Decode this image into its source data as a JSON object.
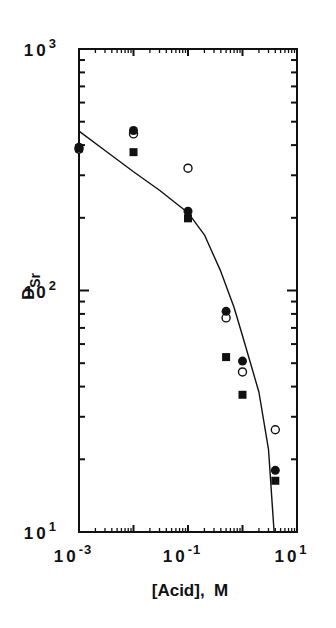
{
  "chart_data": {
    "type": "scatter",
    "title": "",
    "xlabel": "[Acid],  M",
    "ylabel": "D",
    "ylabel_subscript": "Sr",
    "xscale": "log",
    "yscale": "log",
    "xlim": [
      0.001,
      10
    ],
    "ylim": [
      10,
      1000
    ],
    "x_tick_labels": [
      {
        "base": "10",
        "exp": "-3",
        "value": 0.001
      },
      {
        "base": "10",
        "exp": "-1",
        "value": 0.1
      },
      {
        "base": "10",
        "exp": "1",
        "value": 10
      }
    ],
    "y_tick_labels": [
      {
        "base": "10",
        "exp": "3",
        "value": 1000
      },
      {
        "base": "10",
        "exp": "2",
        "value": 100
      },
      {
        "base": "10",
        "exp": "1",
        "value": 10
      }
    ],
    "grid": false,
    "legend": null,
    "series": [
      {
        "name": "filled circles",
        "marker": "filled-circle",
        "points": [
          [
            0.001,
            392
          ],
          [
            0.01,
            460
          ],
          [
            0.1,
            213
          ],
          [
            0.5,
            82
          ],
          [
            1.0,
            51
          ],
          [
            4.0,
            18
          ]
        ]
      },
      {
        "name": "open circles",
        "marker": "open-circle",
        "points": [
          [
            0.001,
            385
          ],
          [
            0.01,
            445
          ],
          [
            0.1,
            321
          ],
          [
            0.5,
            77
          ],
          [
            1.0,
            46
          ],
          [
            4.0,
            26.5
          ]
        ]
      },
      {
        "name": "filled squares",
        "marker": "filled-square",
        "points": [
          [
            0.001,
            388
          ],
          [
            0.01,
            374
          ],
          [
            0.1,
            199
          ],
          [
            0.5,
            53
          ],
          [
            1.0,
            37
          ],
          [
            4.0,
            16.3
          ]
        ]
      },
      {
        "name": "fitted curve",
        "marker": "line",
        "points": [
          [
            0.001,
            457
          ],
          [
            0.003,
            380
          ],
          [
            0.01,
            310
          ],
          [
            0.03,
            260
          ],
          [
            0.1,
            210
          ],
          [
            0.2,
            170
          ],
          [
            0.4,
            120
          ],
          [
            0.7,
            85
          ],
          [
            1.0,
            65
          ],
          [
            2.0,
            38
          ],
          [
            3.0,
            22
          ],
          [
            3.8,
            10
          ]
        ]
      }
    ]
  }
}
